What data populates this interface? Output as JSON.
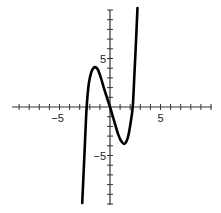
{
  "chart_data": {
    "type": "line",
    "title": "",
    "xlabel": "",
    "ylabel": "",
    "xlim": [
      -9.7,
      10.1
    ],
    "ylim": [
      -10,
      10
    ],
    "grid": false,
    "legend": null,
    "x_ticks_every": 1,
    "y_ticks_every": 1,
    "x_tick_labels": [
      {
        "value": -5,
        "label": "-5"
      },
      {
        "value": 5,
        "label": "5"
      }
    ],
    "y_tick_labels": [
      {
        "value": 5,
        "label": "5"
      },
      {
        "value": -5,
        "label": "-5"
      }
    ],
    "series": [
      {
        "name": "f(x)",
        "color": "#000000",
        "x": [
          -2.75,
          -2.6,
          -2.45,
          -2.31,
          -2.1,
          -1.85,
          -1.6,
          -1.42,
          -1.2,
          -0.9,
          -0.5,
          0.0,
          0.4,
          0.8,
          1.1,
          1.42,
          1.75,
          2.0,
          2.25,
          2.4,
          2.55,
          2.72
        ],
        "y": [
          -9.9,
          -6.5,
          -3.0,
          0.0,
          2.4,
          3.6,
          4.05,
          4.1,
          3.85,
          3.0,
          1.6,
          0.0,
          -1.4,
          -2.8,
          -3.5,
          -3.8,
          -3.2,
          -1.9,
          0.0,
          3.0,
          6.2,
          10.2
        ]
      }
    ]
  },
  "axes": {
    "origin_px": [
      110,
      107
    ],
    "x_scale_px": 10.1,
    "y_scale_px": 9.7,
    "x_range_px": [
      12,
      212
    ],
    "y_range_px": [
      10,
      205
    ],
    "tick_half_len_px": 3,
    "axis_color": "#333333"
  }
}
